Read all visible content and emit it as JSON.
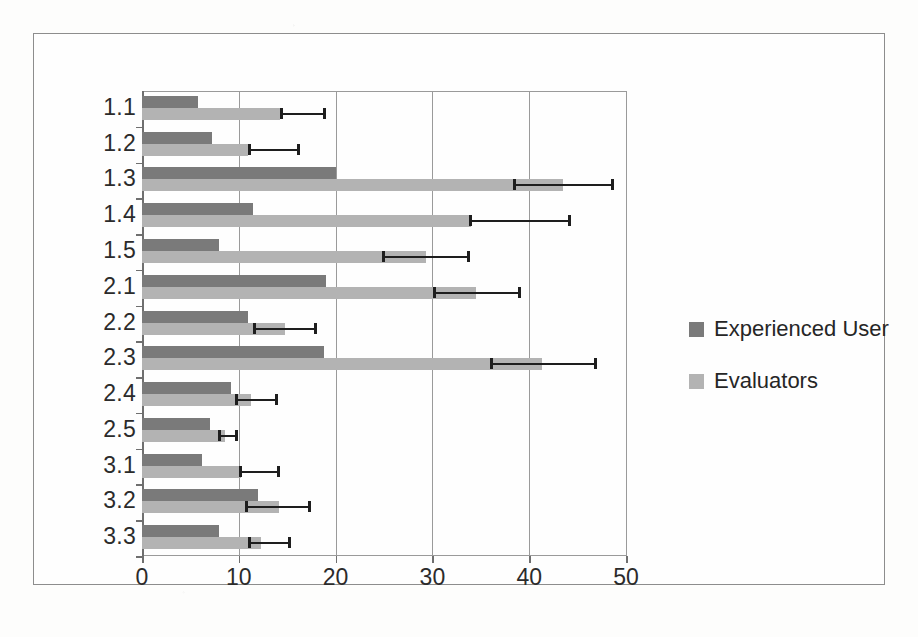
{
  "chart_data": {
    "type": "bar",
    "orientation": "horizontal",
    "title": "",
    "xlabel": "",
    "ylabel": "",
    "xlim": [
      0,
      50
    ],
    "xticks": [
      0,
      10,
      20,
      30,
      40,
      50
    ],
    "xtick_labels": [
      "0",
      "10",
      "20",
      "30",
      "40",
      "50"
    ],
    "grid": "vertical",
    "legend_position": "right",
    "categories": [
      "1.1",
      "1.2",
      "1.3",
      "1.4",
      "1.5",
      "2.1",
      "2.2",
      "2.3",
      "2.4",
      "2.5",
      "3.1",
      "3.2",
      "3.3"
    ],
    "series": [
      {
        "name": "Experienced User",
        "color": "#7a7a7a",
        "values": [
          5.8,
          7.2,
          20.0,
          11.5,
          8.0,
          19.0,
          11.0,
          18.8,
          9.2,
          7.0,
          6.2,
          12.0,
          8.0
        ]
      },
      {
        "name": "Evaluators",
        "color": "#b3b3b3",
        "values": [
          14.3,
          11.0,
          43.5,
          34.0,
          29.3,
          34.5,
          14.8,
          41.3,
          11.3,
          8.6,
          10.2,
          14.2,
          12.3
        ],
        "error_bars": [
          {
            "low": 14.3,
            "high": 19.0
          },
          {
            "low": 11.0,
            "high": 16.3
          },
          {
            "low": 38.3,
            "high": 48.8
          },
          {
            "low": 33.8,
            "high": 44.3
          },
          {
            "low": 24.8,
            "high": 33.9
          },
          {
            "low": 30.1,
            "high": 39.2
          },
          {
            "low": 11.5,
            "high": 18.1
          },
          {
            "low": 36.0,
            "high": 47.0
          },
          {
            "low": 9.6,
            "high": 14.1
          },
          {
            "low": 7.9,
            "high": 9.9
          },
          {
            "low": 10.0,
            "high": 14.3
          },
          {
            "low": 10.6,
            "high": 17.5
          },
          {
            "low": 11.0,
            "high": 15.4
          }
        ]
      }
    ],
    "legend": [
      {
        "label": "Experienced User",
        "color": "#7a7a7a"
      },
      {
        "label": "Evaluators",
        "color": "#b3b3b3"
      }
    ]
  }
}
